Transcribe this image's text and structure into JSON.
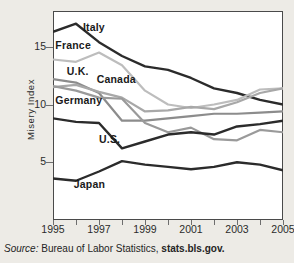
{
  "chart_data": {
    "type": "line",
    "title": "",
    "xlabel": "",
    "ylabel": "Misery Index",
    "xlim": [
      1995,
      2005
    ],
    "ylim": [
      0,
      18.1
    ],
    "yticks": [
      5,
      10,
      15
    ],
    "ytick_labels": [
      "5",
      "10",
      "15"
    ],
    "xticks": [
      1995,
      1996,
      1997,
      1998,
      1999,
      2000,
      2001,
      2002,
      2003,
      2004,
      2005
    ],
    "xtick_labels": [
      "1995",
      "",
      "1997",
      "",
      "1999",
      "",
      "2001",
      "",
      "2003",
      "",
      "2005"
    ],
    "grid": false,
    "legend": "inline-labels",
    "x": [
      1995,
      1996,
      1997,
      1998,
      1999,
      2000,
      2001,
      2002,
      2003,
      2004,
      2005
    ],
    "series": [
      {
        "name": "Italy",
        "color": "#2b2b2b",
        "width": 2.4,
        "values": [
          16.3,
          17.0,
          15.4,
          14.2,
          13.3,
          13.0,
          12.3,
          11.4,
          11.0,
          10.4,
          10.0
        ],
        "label_x": 1996.3,
        "label_y": 16.6
      },
      {
        "name": "France",
        "color": "#bdbdbd",
        "width": 2.2,
        "values": [
          13.9,
          13.7,
          14.5,
          13.4,
          11.2,
          10.0,
          9.7,
          10.0,
          10.4,
          11.3,
          11.4
        ],
        "label_x": 1995.1,
        "label_y": 15.1
      },
      {
        "name": "U.K.",
        "color": "#8c8c8c",
        "width": 2.2,
        "values": [
          12.2,
          11.9,
          11.0,
          8.6,
          8.6,
          8.8,
          9.0,
          9.2,
          9.2,
          9.3,
          9.4
        ],
        "label_x": 1995.6,
        "label_y": 12.8
      },
      {
        "name": "Canada",
        "color": "#a8a8a8",
        "width": 2.2,
        "values": [
          11.5,
          11.7,
          11.1,
          10.6,
          9.4,
          9.5,
          9.8,
          9.6,
          10.2,
          11.0,
          11.4
        ],
        "label_x": 1996.9,
        "label_y": 12.1
      },
      {
        "name": "Germany",
        "color": "#9a9a9a",
        "width": 2.2,
        "values": [
          11.6,
          11.2,
          10.6,
          10.5,
          8.4,
          7.6,
          8.0,
          7.0,
          6.9,
          7.8,
          7.6
        ],
        "label_x": 1995.1,
        "label_y": 10.3
      },
      {
        "name": "U.S.",
        "color": "#2b2b2b",
        "width": 2.4,
        "values": [
          8.8,
          8.5,
          8.4,
          6.2,
          6.8,
          7.4,
          7.6,
          7.4,
          8.1,
          8.3,
          8.6
        ],
        "label_x": 1997.0,
        "label_y": 6.9
      },
      {
        "name": "Japan",
        "color": "#2b2b2b",
        "width": 2.4,
        "values": [
          3.6,
          3.4,
          4.2,
          5.1,
          4.8,
          4.6,
          4.4,
          4.6,
          5.0,
          4.8,
          4.3
        ],
        "label_x": 1995.9,
        "label_y": 3.0
      }
    ]
  },
  "source": {
    "prefix": "Source:",
    "body": "Bureau of Labor Statistics,",
    "url": "stats.bls.gov."
  }
}
